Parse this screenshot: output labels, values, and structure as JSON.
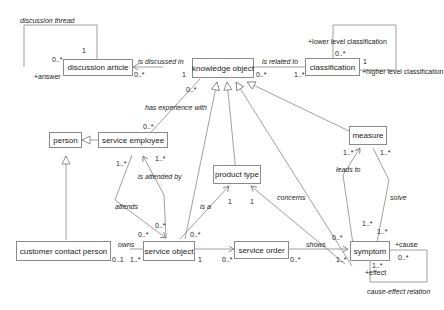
{
  "classes": {
    "discussion_article": "discussion article",
    "knowledge_object": "knowledge object",
    "classification": "classification",
    "person": "person",
    "service_employee": "service employee",
    "product_type": "product type",
    "measure": "measure",
    "customer_contact_person": "customer contact person",
    "service_object": "service object",
    "service_order": "service order",
    "symptom": "symptom"
  },
  "associations": {
    "discussion_thread": "discussion thread",
    "is_discussed_in": "is discussed in",
    "is_related_to": "is related to",
    "has_experience_with": "has experience with",
    "is_attended_by": "is attended by",
    "attends": "attends",
    "is_a": "is a",
    "concerns": "concerns",
    "leads_to": "leads to",
    "solve": "solve",
    "owns": "owns",
    "shows": "shows",
    "cause_effect_relation": "cause-effect relation"
  },
  "roles": {
    "answer": "+answer",
    "lower_level_classification": "+lower level classification",
    "higher_level_classification": "+higher level classification",
    "cause": "+cause",
    "effect": "+effect"
  },
  "multiplicities": {
    "thread_one": "1",
    "thread_many": "0..*",
    "discussed_article": "0..*",
    "discussed_ko": "1",
    "related_ko": "0..*",
    "related_class": "1..*",
    "class_self_lower": "0..*",
    "class_self_higher": "1",
    "exp_ko": "0..*",
    "exp_se": "0..*",
    "attends_se": "1..*",
    "attended_se": "1..*",
    "attends_so": "0..*",
    "attended_so": "0..*",
    "isa_so": "0..*",
    "isa_pt": "1",
    "concerns_pt": "1",
    "leads_measure": "1..*",
    "solve_measure": "1..*",
    "leads_symptom": "1..*",
    "solve_symptom": "1..*",
    "concerns_symptom": "0..*",
    "owns_ccp": "0..1",
    "owns_so": "1..*",
    "order_so": "1",
    "order_order": "0..*",
    "shows_order": "0..*",
    "shows_symptom": "1..*",
    "cause_mult": "0..*",
    "effect_mult": "1..*"
  }
}
